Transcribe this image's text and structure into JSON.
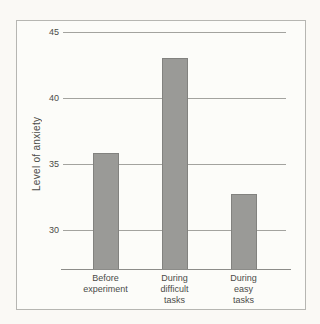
{
  "chart_data": {
    "type": "bar",
    "title": "",
    "categories": [
      "Before\nexperiment",
      "During\ndifficult\ntasks",
      "During\neasy\ntasks"
    ],
    "values": [
      35.8,
      43,
      32.7
    ],
    "xlabel": "",
    "ylabel": "Level of anxiety",
    "yticks": [
      45,
      40,
      35,
      30
    ],
    "ylim": [
      27,
      45
    ],
    "grid": true,
    "legend": "none"
  },
  "colors": {
    "paper": "#faf9f5",
    "paper_inner": "#fcfcf9",
    "frame_border": "#b6b6b2",
    "bar_fill": "#9a9a97",
    "bar_border": "#82827f",
    "gridline": "#a3a39f",
    "axis_line": "#8c8c89",
    "text": "#4b4b48"
  }
}
